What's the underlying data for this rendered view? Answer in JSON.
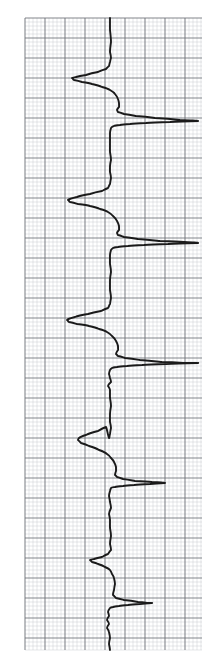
{
  "page": {
    "background_color": "#ffffff",
    "width": 210,
    "height": 663
  },
  "grid": {
    "name": "graph-paper-grid",
    "minor_spacing_px": 4,
    "major_spacing_px": 20,
    "minor_color": "#b9bcc4",
    "major_color": "#6e7279",
    "minor_width_px": 0.5,
    "major_width_px": 1.1,
    "plot_left_px": 25,
    "plot_top_px": 18,
    "plot_right_px": 202,
    "plot_bottom_px": 650
  },
  "trace": {
    "name": "recorder-trace",
    "color": "#1a1a1a",
    "line_width_px": 1.9,
    "baseline_x_px": 110,
    "orientation": "vertical-strip",
    "description": "Repeating peak group: a sharp negative (left) deflection followed by a large positive (right) deflection, repeated with decreasing amplitude from top to bottom."
  },
  "chart_data": {
    "type": "line",
    "subtitle": "",
    "xlabel": "Signal amplitude (arbitrary units)",
    "ylabel": "Time / chart travel (arbitrary units)",
    "orientation": "vertical",
    "grid": true,
    "legend_position": "none",
    "baseline_value": 0,
    "xlim": [
      -60,
      110
    ],
    "ylim": [
      663,
      0
    ],
    "axis_note": "x is horizontal pixel offset from baseline (positive = right); y is vertical pixel position (top = 0)",
    "annotations": [
      {
        "label": "group-1-negative-peak",
        "x": -38,
        "y": 78
      },
      {
        "label": "group-1-positive-peak",
        "x": 88,
        "y": 121
      },
      {
        "label": "group-2-negative-peak",
        "x": -42,
        "y": 200
      },
      {
        "label": "group-2-positive-peak",
        "x": 88,
        "y": 243
      },
      {
        "label": "group-3-negative-peak",
        "x": -43,
        "y": 320
      },
      {
        "label": "group-3-positive-peak",
        "x": 88,
        "y": 363
      },
      {
        "label": "group-4-negative-peak",
        "x": -32,
        "y": 440
      },
      {
        "label": "group-4-positive-peak",
        "x": 55,
        "y": 483
      },
      {
        "label": "group-5-negative-peak",
        "x": -20,
        "y": 560
      },
      {
        "label": "group-5-positive-peak",
        "x": 42,
        "y": 603
      }
    ],
    "series": [
      {
        "name": "recorder-pen",
        "points": [
          [
            0,
            18
          ],
          [
            0,
            30
          ],
          [
            1,
            42
          ],
          [
            0,
            52
          ],
          [
            1,
            58
          ],
          [
            0,
            62
          ],
          [
            -1,
            66
          ],
          [
            -4,
            69
          ],
          [
            -12,
            72
          ],
          [
            -24,
            75
          ],
          [
            -34,
            77
          ],
          [
            -38,
            78
          ],
          [
            -36,
            80
          ],
          [
            -28,
            82
          ],
          [
            -18,
            84
          ],
          [
            -8,
            87
          ],
          [
            0,
            90
          ],
          [
            5,
            94
          ],
          [
            8,
            99
          ],
          [
            9,
            103
          ],
          [
            9,
            107
          ],
          [
            7,
            110
          ],
          [
            8,
            112
          ],
          [
            14,
            114
          ],
          [
            26,
            116
          ],
          [
            45,
            118
          ],
          [
            70,
            120
          ],
          [
            88,
            121
          ],
          [
            60,
            122
          ],
          [
            36,
            123
          ],
          [
            20,
            124
          ],
          [
            10,
            125
          ],
          [
            4,
            126
          ],
          [
            1,
            128
          ],
          [
            0,
            133
          ],
          [
            0,
            140
          ],
          [
            0,
            152
          ],
          [
            1,
            160
          ],
          [
            0,
            166
          ],
          [
            0,
            172
          ],
          [
            1,
            178
          ],
          [
            0,
            184
          ],
          [
            -2,
            188
          ],
          [
            -8,
            191
          ],
          [
            -20,
            194
          ],
          [
            -33,
            197
          ],
          [
            -42,
            200
          ],
          [
            -40,
            202
          ],
          [
            -32,
            204
          ],
          [
            -20,
            206
          ],
          [
            -10,
            209
          ],
          [
            -2,
            212
          ],
          [
            3,
            216
          ],
          [
            7,
            221
          ],
          [
            9,
            226
          ],
          [
            9,
            230
          ],
          [
            7,
            233
          ],
          [
            8,
            235
          ],
          [
            14,
            237
          ],
          [
            28,
            239
          ],
          [
            50,
            241
          ],
          [
            74,
            242
          ],
          [
            88,
            243
          ],
          [
            58,
            244
          ],
          [
            34,
            245
          ],
          [
            18,
            246
          ],
          [
            8,
            247
          ],
          [
            3,
            248
          ],
          [
            1,
            250
          ],
          [
            0,
            255
          ],
          [
            0,
            264
          ],
          [
            1,
            272
          ],
          [
            0,
            280
          ],
          [
            0,
            290
          ],
          [
            1,
            298
          ],
          [
            0,
            304
          ],
          [
            -2,
            308
          ],
          [
            -9,
            311
          ],
          [
            -22,
            314
          ],
          [
            -35,
            317
          ],
          [
            -43,
            320
          ],
          [
            -41,
            322
          ],
          [
            -33,
            324
          ],
          [
            -21,
            326
          ],
          [
            -11,
            329
          ],
          [
            -3,
            332
          ],
          [
            2,
            336
          ],
          [
            6,
            341
          ],
          [
            8,
            346
          ],
          [
            8,
            350
          ],
          [
            6,
            354
          ],
          [
            8,
            356
          ],
          [
            15,
            358
          ],
          [
            30,
            360
          ],
          [
            52,
            362
          ],
          [
            76,
            363
          ],
          [
            88,
            363
          ],
          [
            56,
            364
          ],
          [
            32,
            365
          ],
          [
            17,
            366
          ],
          [
            7,
            367
          ],
          [
            2,
            368
          ],
          [
            0,
            370
          ],
          [
            -1,
            374
          ],
          [
            0,
            378
          ],
          [
            1,
            382
          ],
          [
            -2,
            386
          ],
          [
            0,
            390
          ],
          [
            0,
            398
          ],
          [
            1,
            406
          ],
          [
            0,
            414
          ],
          [
            0,
            422
          ],
          [
            1,
            428
          ],
          [
            0,
            434
          ],
          [
            -1,
            438
          ],
          [
            -4,
            427
          ],
          [
            -12,
            431
          ],
          [
            -24,
            435
          ],
          [
            -31,
            438
          ],
          [
            -32,
            440
          ],
          [
            -29,
            443
          ],
          [
            -21,
            446
          ],
          [
            -11,
            450
          ],
          [
            -3,
            454
          ],
          [
            1,
            458
          ],
          [
            4,
            462
          ],
          [
            6,
            467
          ],
          [
            6,
            471
          ],
          [
            5,
            475
          ],
          [
            7,
            477
          ],
          [
            13,
            479
          ],
          [
            25,
            481
          ],
          [
            42,
            482
          ],
          [
            55,
            483
          ],
          [
            40,
            484
          ],
          [
            24,
            485
          ],
          [
            13,
            486
          ],
          [
            5,
            487
          ],
          [
            1,
            488
          ],
          [
            0,
            491
          ],
          [
            -1,
            496
          ],
          [
            0,
            502
          ],
          [
            1,
            508
          ],
          [
            -1,
            514
          ],
          [
            0,
            520
          ],
          [
            0,
            528
          ],
          [
            1,
            536
          ],
          [
            0,
            544
          ],
          [
            1,
            550
          ],
          [
            -2,
            554
          ],
          [
            -8,
            557
          ],
          [
            -16,
            559
          ],
          [
            -20,
            560
          ],
          [
            -18,
            562
          ],
          [
            -12,
            564
          ],
          [
            -5,
            567
          ],
          [
            0,
            570
          ],
          [
            2,
            574
          ],
          [
            4,
            578
          ],
          [
            5,
            584
          ],
          [
            4,
            590
          ],
          [
            3,
            595
          ],
          [
            6,
            598
          ],
          [
            14,
            600
          ],
          [
            28,
            602
          ],
          [
            38,
            603
          ],
          [
            42,
            603
          ],
          [
            30,
            604
          ],
          [
            18,
            605
          ],
          [
            9,
            606
          ],
          [
            3,
            607
          ],
          [
            0,
            608
          ],
          [
            -2,
            612
          ],
          [
            -1,
            616
          ],
          [
            -3,
            620
          ],
          [
            -1,
            624
          ],
          [
            -3,
            628
          ],
          [
            -1,
            632
          ],
          [
            0,
            638
          ],
          [
            -1,
            644
          ],
          [
            0,
            650
          ]
        ]
      }
    ]
  }
}
